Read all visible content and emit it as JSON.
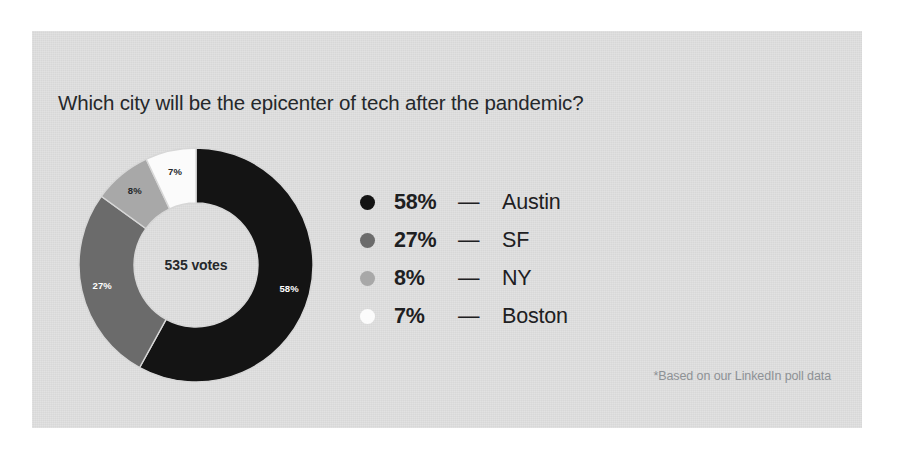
{
  "card": {
    "background_color": "#e0e0e0",
    "page_background_color": "#ffffff"
  },
  "title": "Which city will be the epicenter of tech after the pandemic?",
  "footnote": "*Based on our LinkedIn poll data",
  "donut": {
    "center_label": "535 votes",
    "total_votes": 535
  },
  "legend": {
    "dash": "—",
    "rows": [
      {
        "pct": "58%",
        "name": "Austin",
        "color": "#141414"
      },
      {
        "pct": "27%",
        "name": "SF",
        "color": "#6b6b6b"
      },
      {
        "pct": "8%",
        "name": "NY",
        "color": "#a8a8a8"
      },
      {
        "pct": "7%",
        "name": "Boston",
        "color": "#fbfbfb"
      }
    ]
  },
  "chart_data": {
    "type": "pie",
    "variant": "donut",
    "title": "Which city will be the epicenter of tech after the pandemic?",
    "subtitle": "",
    "annotations": [
      "535 votes",
      "*Based on our LinkedIn poll data"
    ],
    "center_text": "535 votes",
    "total": 535,
    "unit": "%",
    "start_angle_deg": 0,
    "direction": "clockwise",
    "legend_position": "right",
    "grid": false,
    "categories": [
      "Austin",
      "SF",
      "NY",
      "Boston"
    ],
    "values": [
      58,
      27,
      8,
      7
    ],
    "labels": [
      "58%",
      "27%",
      "8%",
      "7%"
    ],
    "colors": [
      "#141414",
      "#6b6b6b",
      "#a8a8a8",
      "#fbfbfb"
    ],
    "label_text_colors": [
      "#ffffff",
      "#ffffff",
      "#25282b",
      "#25282b"
    ],
    "slices": [
      {
        "name": "Austin",
        "value": 58,
        "label": "58%",
        "color": "#141414",
        "label_color": "#ffffff"
      },
      {
        "name": "SF",
        "value": 27,
        "label": "27%",
        "color": "#6b6b6b",
        "label_color": "#ffffff"
      },
      {
        "name": "NY",
        "value": 8,
        "label": "8%",
        "color": "#a8a8a8",
        "label_color": "#25282b"
      },
      {
        "name": "Boston",
        "value": 7,
        "label": "7%",
        "color": "#fbfbfb",
        "label_color": "#25282b"
      }
    ]
  }
}
